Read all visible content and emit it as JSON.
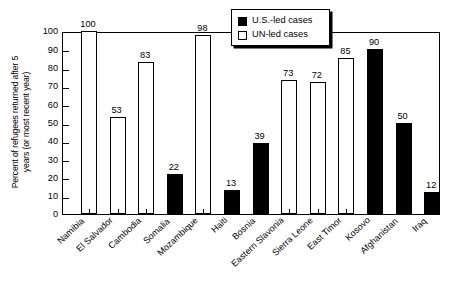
{
  "chart_data": {
    "type": "bar",
    "title": "",
    "xlabel": "",
    "ylabel": "Percent of refugees returned after 5\nyears (or most recent year)",
    "ylim": [
      0,
      100
    ],
    "yticks": [
      0,
      10,
      20,
      30,
      40,
      50,
      60,
      70,
      80,
      90,
      100
    ],
    "grid": false,
    "legend_position": "top-center",
    "categories": [
      "Namibia",
      "El Salvador",
      "Cambodia",
      "Somalia",
      "Mozambique",
      "Haiti",
      "Bosnia",
      "Eastern Slavonia",
      "Sierra Leone",
      "East Timor",
      "Kosovo",
      "Afghanistan",
      "Iraq"
    ],
    "values": [
      100,
      53,
      83,
      22,
      98,
      13,
      39,
      73,
      72,
      85,
      90,
      50,
      12
    ],
    "groups": [
      "un",
      "un",
      "un",
      "us",
      "un",
      "us",
      "us",
      "un",
      "un",
      "un",
      "us",
      "us",
      "us"
    ],
    "series": [
      {
        "name": "U.S.-led cases",
        "key": "us",
        "color": "#000000",
        "points": [
          {
            "category": "Somalia",
            "value": 22
          },
          {
            "category": "Haiti",
            "value": 13
          },
          {
            "category": "Bosnia",
            "value": 39
          },
          {
            "category": "Kosovo",
            "value": 90
          },
          {
            "category": "Afghanistan",
            "value": 50
          },
          {
            "category": "Iraq",
            "value": 12
          }
        ]
      },
      {
        "name": "UN-led cases",
        "key": "un",
        "color": "#ffffff",
        "points": [
          {
            "category": "Namibia",
            "value": 100
          },
          {
            "category": "El Salvador",
            "value": 53
          },
          {
            "category": "Cambodia",
            "value": 83
          },
          {
            "category": "Mozambique",
            "value": 98
          },
          {
            "category": "Eastern Slavonia",
            "value": 73
          },
          {
            "category": "Sierra Leone",
            "value": 72
          },
          {
            "category": "East Timor",
            "value": 85
          }
        ]
      }
    ]
  },
  "legend": {
    "items": [
      {
        "label": "U.S.-led cases",
        "key": "us"
      },
      {
        "label": "UN-led cases",
        "key": "un"
      }
    ]
  }
}
